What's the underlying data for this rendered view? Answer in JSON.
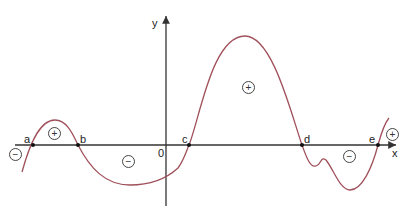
{
  "diagram": {
    "type": "sign chart of a function graph",
    "axes": {
      "x_label": "x",
      "y_label": "y",
      "origin_label": "0"
    },
    "zeros": [
      {
        "label": "a",
        "x": 33
      },
      {
        "label": "b",
        "x": 78
      },
      {
        "label": "c",
        "x": 189
      },
      {
        "label": "d",
        "x": 302
      },
      {
        "label": "e",
        "x": 378
      }
    ],
    "sign_regions": [
      {
        "interval": "x < a",
        "sign": "−"
      },
      {
        "interval": "a < x < b",
        "sign": "+"
      },
      {
        "interval": "b < x < c",
        "sign": "−"
      },
      {
        "interval": "c < x < d",
        "sign": "+"
      },
      {
        "interval": "d < x < e",
        "sign": "−"
      },
      {
        "interval": "x > e",
        "sign": "+"
      }
    ],
    "colors": {
      "curve": "#a0505a",
      "axes": "#333333",
      "points": "#111111"
    }
  }
}
